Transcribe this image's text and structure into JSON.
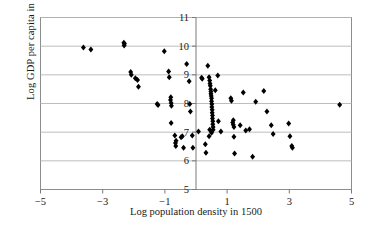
{
  "chart_data": {
    "type": "scatter",
    "title": "",
    "xlabel": "Log population density in 1500",
    "ylabel": "Log GDP per capita in 1995",
    "xlim": [
      -5,
      5
    ],
    "ylim": [
      5,
      11
    ],
    "xticks": [
      "-5",
      "-3",
      "-1",
      "1",
      "3",
      "5"
    ],
    "xtick_values": [
      -5,
      -3,
      -1,
      1,
      3,
      5
    ],
    "yticks": [
      "5",
      "6",
      "7",
      "8",
      "9",
      "10",
      "11"
    ],
    "ytick_values": [
      5,
      6,
      7,
      8,
      9,
      10,
      11
    ],
    "grid": "horizontal",
    "legend": "none",
    "marker": "diamond",
    "marker_color": "#000000",
    "zero_axis_line": true,
    "points": [
      [
        -3.62,
        9.95
      ],
      [
        -3.38,
        9.88
      ],
      [
        -2.32,
        10.12
      ],
      [
        -2.31,
        10.02
      ],
      [
        -2.3,
        10.08
      ],
      [
        -2.1,
        9.1
      ],
      [
        -2.08,
        9.0
      ],
      [
        -1.95,
        8.88
      ],
      [
        -1.88,
        8.82
      ],
      [
        -1.85,
        8.58
      ],
      [
        -1.25,
        7.98
      ],
      [
        -1.22,
        7.95
      ],
      [
        -1.02,
        9.82
      ],
      [
        -0.88,
        9.12
      ],
      [
        -0.86,
        8.92
      ],
      [
        -0.82,
        8.12
      ],
      [
        -0.8,
        8.02
      ],
      [
        -0.79,
        7.92
      ],
      [
        -0.81,
        8.22
      ],
      [
        -0.8,
        7.32
      ],
      [
        -0.68,
        6.88
      ],
      [
        -0.66,
        6.62
      ],
      [
        -0.65,
        6.52
      ],
      [
        -0.64,
        6.7
      ],
      [
        -0.48,
        6.82
      ],
      [
        -0.44,
        6.86
      ],
      [
        -0.4,
        6.46
      ],
      [
        -0.3,
        9.38
      ],
      [
        -0.22,
        8.78
      ],
      [
        -0.2,
        7.98
      ],
      [
        -0.18,
        7.72
      ],
      [
        -0.12,
        6.88
      ],
      [
        -0.1,
        6.46
      ],
      [
        0.08,
        7.02
      ],
      [
        0.18,
        8.9
      ],
      [
        0.2,
        8.86
      ],
      [
        0.3,
        6.58
      ],
      [
        0.32,
        6.28
      ],
      [
        0.38,
        9.32
      ],
      [
        0.42,
        8.92
      ],
      [
        0.44,
        8.8
      ],
      [
        0.45,
        8.7
      ],
      [
        0.46,
        8.62
      ],
      [
        0.47,
        8.5
      ],
      [
        0.48,
        8.42
      ],
      [
        0.48,
        8.34
      ],
      [
        0.49,
        8.26
      ],
      [
        0.5,
        8.18
      ],
      [
        0.5,
        8.08
      ],
      [
        0.51,
        7.98
      ],
      [
        0.51,
        7.88
      ],
      [
        0.52,
        7.78
      ],
      [
        0.52,
        7.68
      ],
      [
        0.53,
        7.58
      ],
      [
        0.53,
        7.48
      ],
      [
        0.54,
        7.38
      ],
      [
        0.54,
        7.28
      ],
      [
        0.55,
        7.18
      ],
      [
        0.55,
        7.08
      ],
      [
        0.5,
        6.98
      ],
      [
        0.44,
        7.08
      ],
      [
        0.42,
        6.86
      ],
      [
        0.62,
        8.46
      ],
      [
        0.7,
        8.98
      ],
      [
        0.72,
        7.38
      ],
      [
        0.8,
        7.02
      ],
      [
        1.12,
        8.18
      ],
      [
        1.14,
        8.1
      ],
      [
        1.18,
        7.34
      ],
      [
        1.2,
        7.26
      ],
      [
        1.22,
        7.18
      ],
      [
        1.2,
        7.42
      ],
      [
        1.22,
        6.84
      ],
      [
        1.24,
        6.26
      ],
      [
        1.42,
        7.24
      ],
      [
        1.52,
        8.38
      ],
      [
        1.6,
        7.06
      ],
      [
        1.72,
        7.1
      ],
      [
        1.82,
        6.14
      ],
      [
        1.92,
        8.06
      ],
      [
        2.18,
        8.44
      ],
      [
        2.28,
        7.72
      ],
      [
        2.42,
        7.24
      ],
      [
        2.48,
        6.94
      ],
      [
        2.98,
        7.3
      ],
      [
        3.02,
        6.86
      ],
      [
        3.08,
        6.52
      ],
      [
        3.1,
        6.46
      ],
      [
        4.62,
        7.96
      ]
    ]
  },
  "axis": {
    "xlabel": "Log population density in 1500",
    "ylabel": "Log GDP per capita in 1995"
  },
  "caption": {
    "text": ""
  }
}
